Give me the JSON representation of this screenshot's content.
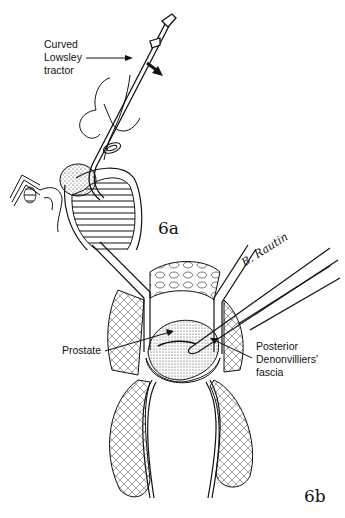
{
  "figures": [
    {
      "id": "6a",
      "number_label": "6a",
      "labels": [
        {
          "key": "tractor",
          "text": "Curved\nLowsley\ntractor"
        }
      ],
      "annotations": [
        "arrow indicating downward traction direction"
      ]
    },
    {
      "id": "6b",
      "number_label": "6b",
      "labels": [
        {
          "key": "prostate",
          "text": "Prostate"
        },
        {
          "key": "fascia",
          "text": "Posterior\nDenonvilliers'\nfascia"
        }
      ],
      "signature": "B. Rautin"
    }
  ],
  "colors": {
    "ink": "#111111",
    "background": "#ffffff"
  }
}
